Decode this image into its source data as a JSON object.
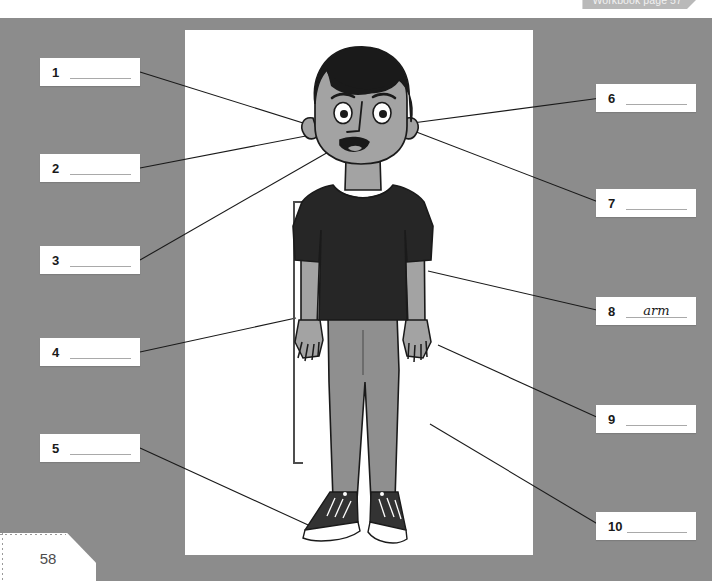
{
  "header": {
    "workbook_tab": "Workbook page 57"
  },
  "footer": {
    "page_number": "58"
  },
  "illustration": {
    "alt_name": "cartoon-boy-full-body",
    "colors": {
      "background": "#8c8c8c",
      "panel": "#ffffff",
      "skin": "#a3a3a3",
      "hair": "#1a1a1a",
      "shirt": "#262626",
      "pants": "#8f8f8f",
      "shoe": "#333333",
      "sole": "#ffffff",
      "outline": "#1a1a1a",
      "leader_line": "#1a1a1a"
    }
  },
  "labels": {
    "left": [
      {
        "number": "1",
        "answer": ""
      },
      {
        "number": "2",
        "answer": ""
      },
      {
        "number": "3",
        "answer": ""
      },
      {
        "number": "4",
        "answer": ""
      },
      {
        "number": "5",
        "answer": ""
      }
    ],
    "right": [
      {
        "number": "6",
        "answer": ""
      },
      {
        "number": "7",
        "answer": ""
      },
      {
        "number": "8",
        "answer": "arm"
      },
      {
        "number": "9",
        "answer": ""
      },
      {
        "number": "10",
        "answer": ""
      }
    ]
  }
}
